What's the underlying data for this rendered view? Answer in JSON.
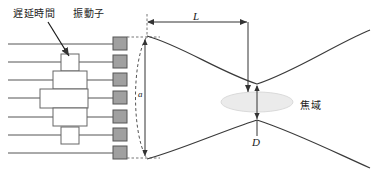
{
  "figure": {
    "width": 386,
    "height": 173,
    "background": "#ffffff",
    "stroke_color": "#444444",
    "text_color": "#1a1a1a"
  },
  "labels": {
    "delay_time": "遅延時間",
    "transducer": "振動子",
    "focal_zone": "焦域",
    "length_L": "L",
    "diameter_D": "D",
    "aperture": "a"
  },
  "array": {
    "element_count": 7,
    "element_color": "#a0a0a0",
    "element_stroke": "#555555",
    "element_width": 14,
    "element_height": 13,
    "element_x": 113,
    "row_y": [
      44,
      62,
      80,
      98,
      117,
      135,
      153
    ],
    "elements": [
      {
        "index": 1,
        "y": 44
      },
      {
        "index": 2,
        "y": 62
      },
      {
        "index": 3,
        "y": 80
      },
      {
        "index": 4,
        "y": 98
      },
      {
        "index": 5,
        "y": 117
      },
      {
        "index": 6,
        "y": 135
      },
      {
        "index": 7,
        "y": 153
      }
    ]
  },
  "delay_boxes": [
    {
      "row": 1,
      "width": 0,
      "label": ""
    },
    {
      "row": 2,
      "width": 18,
      "label": ""
    },
    {
      "row": 3,
      "width": 34,
      "label": ""
    },
    {
      "row": 4,
      "width": 48,
      "label": ""
    },
    {
      "row": 5,
      "width": 34,
      "label": ""
    },
    {
      "row": 6,
      "width": 18,
      "label": ""
    },
    {
      "row": 7,
      "width": 0,
      "label": ""
    }
  ],
  "focal_zone": {
    "cx": 257,
    "cy": 102,
    "rx": 36,
    "ry": 10,
    "fill": "#ebebeb",
    "stroke": "#d4d4d4"
  },
  "dimensions": {
    "L": {
      "x1": 147,
      "x2": 248,
      "y": 22,
      "label": "L"
    },
    "D": {
      "x": 257,
      "y1": 84,
      "y2": 120,
      "label": "D"
    },
    "aperture": {
      "x": 145,
      "y1": 38,
      "y2": 158,
      "label": "a"
    }
  },
  "annotations": {
    "arrow_from": {
      "x": 52,
      "y": 22
    },
    "arrow_to": {
      "x": 72,
      "y": 58
    }
  }
}
